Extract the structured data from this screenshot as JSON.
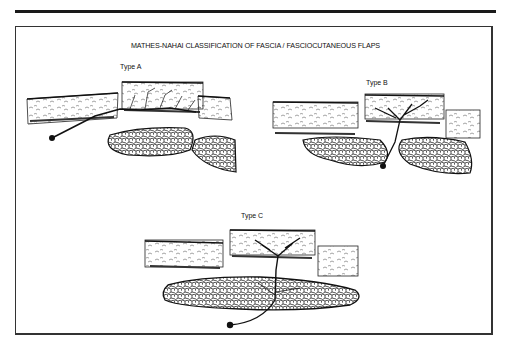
{
  "figure": {
    "title": "MATHES-NAHAI CLASSIFICATION OF FASCIA / FASCIOCUTANEOUS FLAPS",
    "panels": [
      {
        "id": "A",
        "label": "Type A"
      },
      {
        "id": "B",
        "label": "Type B"
      },
      {
        "id": "C",
        "label": "Type C"
      }
    ],
    "colors": {
      "ink": "#111111",
      "frame": "#333333",
      "background": "#ffffff"
    }
  }
}
